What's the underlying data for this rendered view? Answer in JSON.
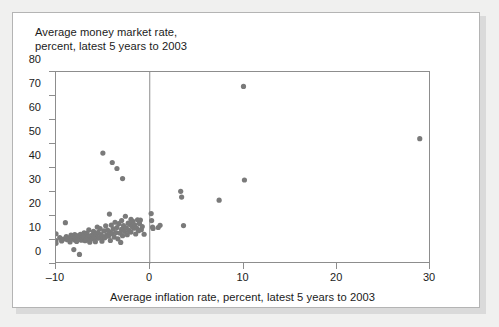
{
  "chart_data": {
    "type": "scatter",
    "title": "Average money market rate,\npercent, latest 5 years to 2003",
    "ylabel": "Average money market rate, percent, latest 5 years to 2003",
    "xlabel": "Average inflation rate, percent, latest 5 years to 2003",
    "xlim": [
      -10,
      30
    ],
    "ylim": [
      0,
      80
    ],
    "xticks": [
      -10,
      0,
      10,
      20,
      30
    ],
    "xtick_labels": [
      "–10",
      "0",
      "10",
      "20",
      "30"
    ],
    "yticks": [
      0,
      10,
      20,
      30,
      40,
      50,
      60,
      70,
      80
    ],
    "ytick_labels": [
      "0",
      "10",
      "20",
      "30",
      "40",
      "50",
      "60",
      "70",
      "80"
    ],
    "grid": false,
    "legend": null,
    "marker_color": "#7a7a7a",
    "marker_size": 2.6,
    "reference_lines": [
      {
        "axis": "x",
        "value": 0,
        "color": "#8d8d8d"
      }
    ],
    "points": [
      [
        -10.0,
        12.6
      ],
      [
        -10.0,
        9.8
      ],
      [
        -10.0,
        8.6
      ],
      [
        -9.6,
        11.0
      ],
      [
        -9.4,
        9.6
      ],
      [
        -9.2,
        10.4
      ],
      [
        -9.0,
        17.2
      ],
      [
        -8.9,
        11.4
      ],
      [
        -8.8,
        10.1
      ],
      [
        -8.6,
        10.8
      ],
      [
        -8.5,
        9.2
      ],
      [
        -8.4,
        12.0
      ],
      [
        -8.3,
        10.5
      ],
      [
        -8.2,
        11.6
      ],
      [
        -8.1,
        6.0
      ],
      [
        -8.0,
        10.0
      ],
      [
        -8.0,
        12.2
      ],
      [
        -7.9,
        11.2
      ],
      [
        -7.8,
        9.4
      ],
      [
        -7.7,
        10.9
      ],
      [
        -7.6,
        11.8
      ],
      [
        -7.5,
        4.0
      ],
      [
        -7.5,
        10.2
      ],
      [
        -7.4,
        12.4
      ],
      [
        -7.3,
        9.9
      ],
      [
        -7.2,
        11.1
      ],
      [
        -7.1,
        10.6
      ],
      [
        -7.0,
        13.0
      ],
      [
        -7.0,
        11.5
      ],
      [
        -6.9,
        9.7
      ],
      [
        -6.8,
        10.3
      ],
      [
        -6.7,
        12.8
      ],
      [
        -6.6,
        11.3
      ],
      [
        -6.5,
        10.0
      ],
      [
        -6.5,
        14.2
      ],
      [
        -6.4,
        9.1
      ],
      [
        -6.3,
        11.7
      ],
      [
        -6.2,
        10.7
      ],
      [
        -6.1,
        12.1
      ],
      [
        -6.0,
        13.6
      ],
      [
        -6.0,
        10.4
      ],
      [
        -5.9,
        11.9
      ],
      [
        -5.8,
        9.3
      ],
      [
        -5.7,
        12.5
      ],
      [
        -5.6,
        15.4
      ],
      [
        -5.5,
        10.8
      ],
      [
        -5.5,
        13.2
      ],
      [
        -5.4,
        11.0
      ],
      [
        -5.3,
        14.8
      ],
      [
        -5.2,
        12.3
      ],
      [
        -5.1,
        9.5
      ],
      [
        -5.0,
        46.2
      ],
      [
        -5.0,
        11.4
      ],
      [
        -4.9,
        13.8
      ],
      [
        -4.8,
        10.9
      ],
      [
        -4.7,
        15.9
      ],
      [
        -4.6,
        12.0
      ],
      [
        -4.5,
        14.1
      ],
      [
        -4.4,
        11.6
      ],
      [
        -4.3,
        20.8
      ],
      [
        -4.3,
        13.4
      ],
      [
        -4.2,
        9.8
      ],
      [
        -4.1,
        16.2
      ],
      [
        -4.0,
        42.3
      ],
      [
        -4.0,
        12.7
      ],
      [
        -3.9,
        14.6
      ],
      [
        -3.8,
        11.2
      ],
      [
        -3.7,
        17.4
      ],
      [
        -3.6,
        13.1
      ],
      [
        -3.5,
        39.8
      ],
      [
        -3.5,
        15.2
      ],
      [
        -3.4,
        10.5
      ],
      [
        -3.3,
        16.8
      ],
      [
        -3.2,
        12.9
      ],
      [
        -3.1,
        9.0
      ],
      [
        -3.0,
        14.4
      ],
      [
        -3.0,
        18.1
      ],
      [
        -2.9,
        35.6
      ],
      [
        -2.9,
        11.8
      ],
      [
        -2.8,
        16.0
      ],
      [
        -2.7,
        13.6
      ],
      [
        -2.6,
        19.9
      ],
      [
        -2.5,
        15.1
      ],
      [
        -2.4,
        12.2
      ],
      [
        -2.3,
        17.0
      ],
      [
        -2.2,
        14.0
      ],
      [
        -2.1,
        16.5
      ],
      [
        -2.0,
        18.6
      ],
      [
        -2.0,
        13.3
      ],
      [
        -1.9,
        15.7
      ],
      [
        -1.8,
        17.8
      ],
      [
        -1.7,
        14.9
      ],
      [
        -1.6,
        16.3
      ],
      [
        -1.5,
        12.5
      ],
      [
        -1.4,
        15.0
      ],
      [
        -1.3,
        18.4
      ],
      [
        -1.2,
        13.9
      ],
      [
        -1.1,
        16.9
      ],
      [
        -1.0,
        18.3
      ],
      [
        -0.9,
        14.3
      ],
      [
        -0.8,
        15.6
      ],
      [
        -0.6,
        12.4
      ],
      [
        0.15,
        21.0
      ],
      [
        0.2,
        18.1
      ],
      [
        0.3,
        15.4
      ],
      [
        0.35,
        14.8
      ],
      [
        0.9,
        15.2
      ],
      [
        1.1,
        16.1
      ],
      [
        3.3,
        30.3
      ],
      [
        3.4,
        27.9
      ],
      [
        3.6,
        16.0
      ],
      [
        7.4,
        26.6
      ],
      [
        10.0,
        74.0
      ],
      [
        10.1,
        35.0
      ],
      [
        28.8,
        52.2
      ]
    ]
  }
}
